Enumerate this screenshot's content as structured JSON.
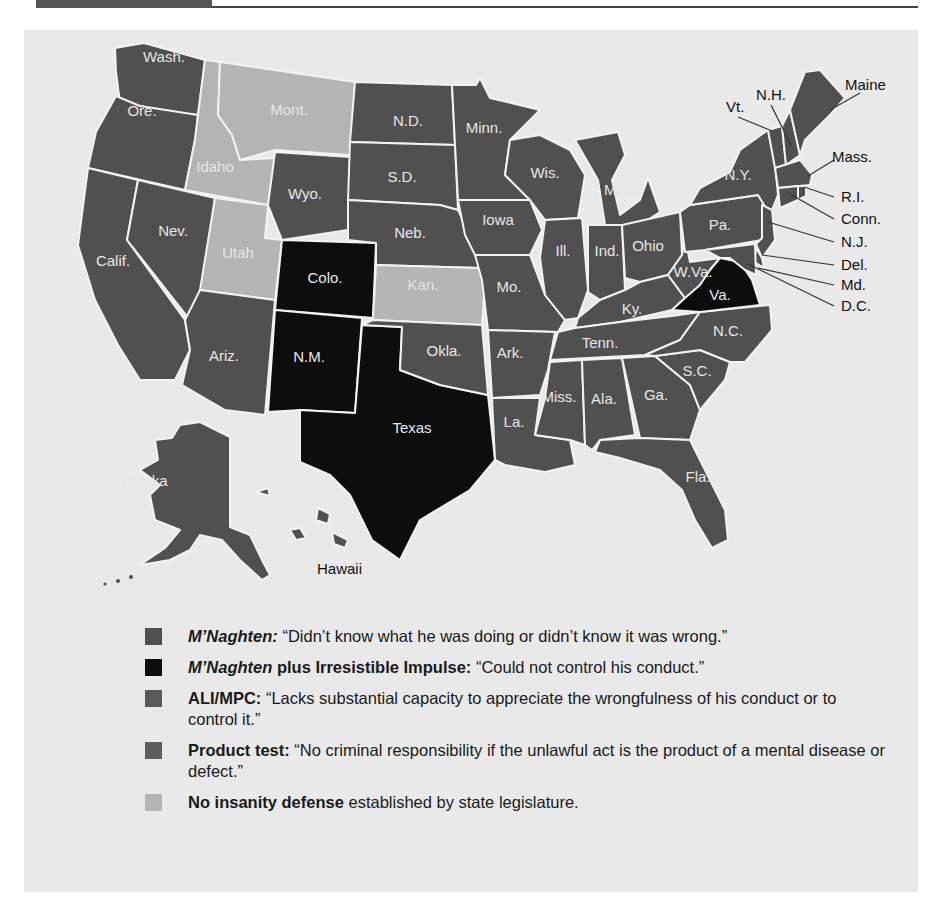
{
  "colors": {
    "mnaghten": "#505050",
    "irresistible": "#0d0d0d",
    "ali_mpc": "#5a5a5a",
    "product": "#5e5e5e",
    "none": "#b4b4b4",
    "background": "#e9e9e9",
    "border": "#f2f2f2"
  },
  "map": {
    "states": [
      {
        "abbr": "Wash.",
        "test": "mnaghten"
      },
      {
        "abbr": "Ore.",
        "test": "mnaghten"
      },
      {
        "abbr": "Calif.",
        "test": "mnaghten"
      },
      {
        "abbr": "Nev.",
        "test": "mnaghten"
      },
      {
        "abbr": "Idaho",
        "test": "none"
      },
      {
        "abbr": "Mont.",
        "test": "none"
      },
      {
        "abbr": "Utah",
        "test": "none"
      },
      {
        "abbr": "Kan.",
        "test": "none"
      },
      {
        "abbr": "Wyo.",
        "test": "mnaghten"
      },
      {
        "abbr": "Colo.",
        "test": "irresistible"
      },
      {
        "abbr": "N.M.",
        "test": "irresistible"
      },
      {
        "abbr": "Texas",
        "test": "irresistible"
      },
      {
        "abbr": "Va.",
        "test": "irresistible"
      },
      {
        "abbr": "Ariz.",
        "test": "mnaghten"
      },
      {
        "abbr": "N.D.",
        "test": "mnaghten"
      },
      {
        "abbr": "S.D.",
        "test": "mnaghten"
      },
      {
        "abbr": "Neb.",
        "test": "mnaghten"
      },
      {
        "abbr": "Okla.",
        "test": "mnaghten"
      },
      {
        "abbr": "Minn.",
        "test": "mnaghten"
      },
      {
        "abbr": "Iowa",
        "test": "mnaghten"
      },
      {
        "abbr": "Mo.",
        "test": "mnaghten"
      },
      {
        "abbr": "Ark.",
        "test": "mnaghten"
      },
      {
        "abbr": "La.",
        "test": "mnaghten"
      },
      {
        "abbr": "Wis.",
        "test": "mnaghten"
      },
      {
        "abbr": "Ill.",
        "test": "mnaghten"
      },
      {
        "abbr": "Mich.",
        "test": "mnaghten"
      },
      {
        "abbr": "Ind.",
        "test": "mnaghten"
      },
      {
        "abbr": "Ohio",
        "test": "mnaghten"
      },
      {
        "abbr": "Ky.",
        "test": "mnaghten"
      },
      {
        "abbr": "Tenn.",
        "test": "mnaghten"
      },
      {
        "abbr": "Miss.",
        "test": "mnaghten"
      },
      {
        "abbr": "Ala.",
        "test": "mnaghten"
      },
      {
        "abbr": "Ga.",
        "test": "mnaghten"
      },
      {
        "abbr": "Fla.",
        "test": "mnaghten"
      },
      {
        "abbr": "S.C.",
        "test": "mnaghten"
      },
      {
        "abbr": "N.C.",
        "test": "mnaghten"
      },
      {
        "abbr": "W.Va.",
        "test": "mnaghten"
      },
      {
        "abbr": "Pa.",
        "test": "mnaghten"
      },
      {
        "abbr": "N.Y.",
        "test": "mnaghten"
      },
      {
        "abbr": "Vt.",
        "test": "mnaghten"
      },
      {
        "abbr": "N.H.",
        "test": "mnaghten"
      },
      {
        "abbr": "Maine",
        "test": "mnaghten"
      },
      {
        "abbr": "Mass.",
        "test": "mnaghten"
      },
      {
        "abbr": "R.I.",
        "test": "mnaghten"
      },
      {
        "abbr": "Conn.",
        "test": "mnaghten"
      },
      {
        "abbr": "N.J.",
        "test": "mnaghten"
      },
      {
        "abbr": "Del.",
        "test": "mnaghten"
      },
      {
        "abbr": "Md.",
        "test": "mnaghten"
      },
      {
        "abbr": "D.C.",
        "test": "mnaghten"
      },
      {
        "abbr": "Alaska",
        "test": "mnaghten"
      },
      {
        "abbr": "Hawaii",
        "test": "mnaghten"
      }
    ],
    "labels": {
      "wash": "Wash.",
      "ore": "Ore.",
      "calif": "Calif.",
      "nev": "Nev.",
      "idaho": "Idaho",
      "mont": "Mont.",
      "utah": "Utah",
      "wyo": "Wyo.",
      "colo": "Colo.",
      "ariz": "Ariz.",
      "nm": "N.M.",
      "texas": "Texas",
      "nd": "N.D.",
      "sd": "S.D.",
      "neb": "Neb.",
      "kan": "Kan.",
      "okla": "Okla.",
      "minn": "Minn.",
      "iowa": "Iowa",
      "mo": "Mo.",
      "ark": "Ark.",
      "la": "La.",
      "wis": "Wis.",
      "ill": "Ill.",
      "mich": "Mich.",
      "ind": "Ind.",
      "ohio": "Ohio",
      "ky": "Ky.",
      "tenn": "Tenn.",
      "miss": "Miss.",
      "ala": "Ala.",
      "ga": "Ga.",
      "fla": "Fla.",
      "sc": "S.C.",
      "nc": "N.C.",
      "wva": "W.Va.",
      "va": "Va.",
      "pa": "Pa.",
      "ny": "N.Y.",
      "vt": "Vt.",
      "nh": "N.H.",
      "maine": "Maine",
      "mass": "Mass.",
      "ri": "R.I.",
      "conn": "Conn.",
      "nj": "N.J.",
      "del": "Del.",
      "md": "Md.",
      "dc": "D.C.",
      "alaska": "Alaska",
      "hawaii": "Hawaii"
    }
  },
  "legend": [
    {
      "key": "mnaghten",
      "term": "M’Naghten:",
      "term_style": "bold-italic",
      "term_suffix": "",
      "desc": " “Didn’t know what he was doing or didn’t know it was wrong.”"
    },
    {
      "key": "irresistible",
      "term": "M’Naghten",
      "term_style": "bold-italic",
      "term_suffix": " plus Irresistible Impulse:",
      "desc": " “Could not control his conduct.”"
    },
    {
      "key": "ali_mpc",
      "term": "ALI/MPC:",
      "term_style": "bold",
      "term_suffix": "",
      "desc": " “Lacks substantial capacity to appreciate the wrongfulness of his conduct or to control it.”"
    },
    {
      "key": "product",
      "term": "Product test:",
      "term_style": "bold",
      "term_suffix": "",
      "desc": " “No criminal responsibility if the unlawful act is the product of a mental disease or defect.”"
    },
    {
      "key": "none",
      "term": "No insanity defense",
      "term_style": "bold",
      "term_suffix": "",
      "desc": " established by state legislature."
    }
  ]
}
